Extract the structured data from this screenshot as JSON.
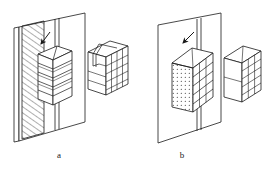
{
  "figure": {
    "type": "technical-line-drawing",
    "background_color": "#ffffff",
    "line_color": "#1a1a1a",
    "panels": [
      {
        "id": "a",
        "caption": "a",
        "elements": [
          "slab-plate-with-vertical-slot",
          "hatched-section-band",
          "layered-stacked-block-attached",
          "insertion-arrow",
          "detached-gridded-block"
        ],
        "block_layers": 5,
        "detached_block_face_grid": {
          "columns": 4,
          "rows": 4
        },
        "fill_pattern": "diagonal-hatching"
      },
      {
        "id": "b",
        "caption": "b",
        "elements": [
          "slab-plate-with-vertical-slot",
          "stippled-front-face-block-attached",
          "insertion-arrow",
          "detached-gridded-block"
        ],
        "block_layers": 5,
        "detached_block_face_grid": {
          "columns": 3,
          "rows": 5
        },
        "fill_pattern": "stipple-dots"
      }
    ]
  },
  "captions": {
    "a": "a",
    "b": "b"
  },
  "colors": {
    "stroke": "#1a1a1a",
    "fill": "#ffffff",
    "background": "#ffffff"
  }
}
